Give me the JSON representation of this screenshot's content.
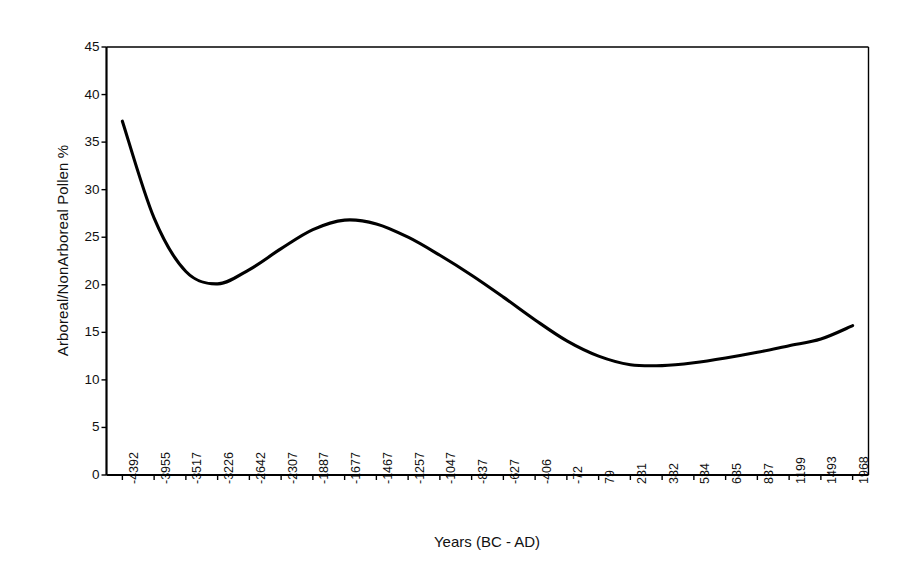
{
  "figure": {
    "background_color": "#ffffff",
    "line_color": "#000000",
    "axis_color": "#000000"
  },
  "chart_data": {
    "type": "line",
    "title": "",
    "subtitle": "",
    "xlabel": "Years (BC - AD)",
    "ylabel": "Arboreal/NonArboreal Pollen %",
    "grid": false,
    "legend": "none",
    "ylim": [
      0,
      45
    ],
    "ytick_labels": [
      "0",
      "5",
      "10",
      "15",
      "20",
      "25",
      "30",
      "35",
      "40",
      "45"
    ],
    "ytick_values": [
      0,
      5,
      10,
      15,
      20,
      25,
      30,
      35,
      40,
      45
    ],
    "categories": [
      "-4392",
      "-3955",
      "-3517",
      "-3226",
      "-2642",
      "-2307",
      "-1887",
      "-1677",
      "-1467",
      "-1257",
      "-1047",
      "-837",
      "-627",
      "-406",
      "-72",
      "79",
      "231",
      "382",
      "534",
      "685",
      "837",
      "1199",
      "1493",
      "1968"
    ],
    "series": [
      {
        "name": "Arboreal/NonArboreal Pollen %",
        "values": [
          37.2,
          27.0,
          21.4,
          20.1,
          21.6,
          23.8,
          25.8,
          26.8,
          26.4,
          25.0,
          23.1,
          21.0,
          18.7,
          16.3,
          14.1,
          12.5,
          11.6,
          11.5,
          11.8,
          12.3,
          12.9,
          13.6,
          14.3,
          15.7
        ]
      }
    ],
    "annotations": []
  }
}
